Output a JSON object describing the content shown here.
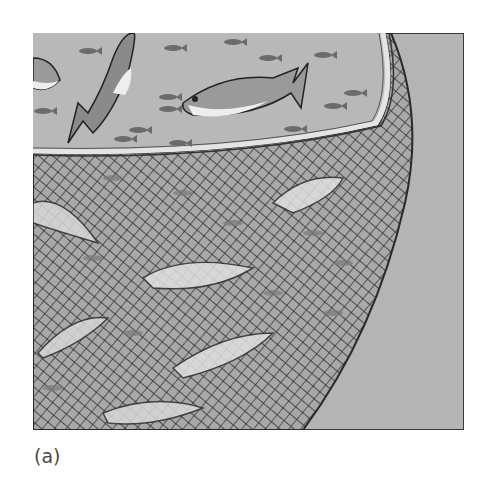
{
  "figure": {
    "label": "(a)",
    "colors": {
      "water": "#b4b4b4",
      "frame_border": "#3a3a3a",
      "net_lines": "#2a2a2a",
      "rim": "#d8d8d8",
      "fish_dark": "#555555",
      "fish_light": "#e8e8e8"
    }
  }
}
